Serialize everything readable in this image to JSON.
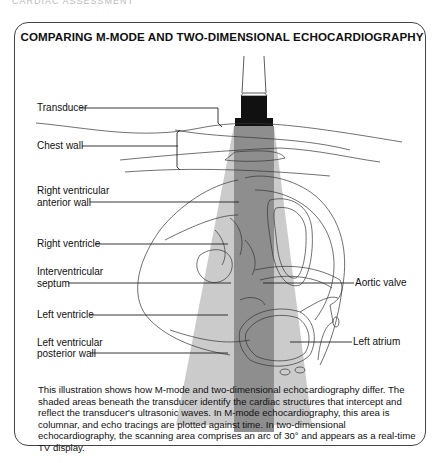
{
  "page_header": "CARDIAC ASSESSMENT",
  "figure": {
    "title": "COMPARING M-MODE AND TWO-DIMENSIONAL ECHOCARDIOGRAPHY",
    "labels_left": {
      "transducer": "Transducer",
      "chest_wall": "Chest wall",
      "rv_anterior_wall_1": "Right ventricular",
      "rv_anterior_wall_2": "anterior wall",
      "right_ventricle": "Right ventricle",
      "septum_1": "Interventricular",
      "septum_2": "septum",
      "left_ventricle": "Left ventricle",
      "lv_posterior_wall_1": "Left ventricular",
      "lv_posterior_wall_2": "posterior wall"
    },
    "labels_right": {
      "aortic_valve": "Aortic valve",
      "left_atrium": "Left atrium"
    },
    "colors": {
      "m_mode_column": "#8f8f8f",
      "two_d_fan": "#c9c9c9",
      "transducer": "#111111",
      "outline": "#333333"
    },
    "caption": "This illustration shows how M-mode and two-dimensional echocardiography differ. The shaded areas beneath the transducer identify the cardiac structures that intercept and reflect the transducer's ultrasonic waves. In M-mode echocardiography, this area is columnar, and echo tracings are plotted against time. In two-dimensional echocardiography, the scanning area comprises an arc of 30° and appears as a real-time TV display."
  }
}
